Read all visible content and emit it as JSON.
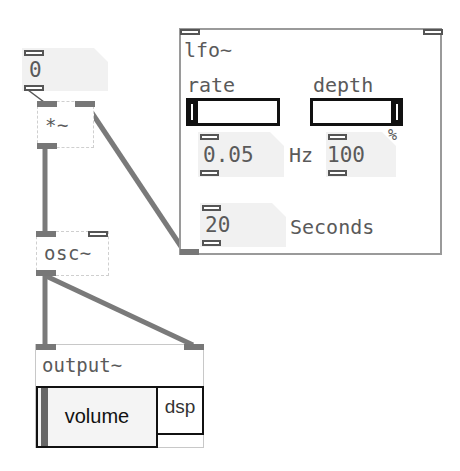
{
  "patch": {
    "top_number": {
      "value": "0"
    },
    "multiply": {
      "label": "*~"
    },
    "osc": {
      "label": "osc~"
    },
    "lfo": {
      "title": "lfo~",
      "rate": {
        "label": "rate",
        "value": "0.05",
        "unit": "Hz"
      },
      "depth": {
        "label": "depth",
        "value": "100",
        "unit": "%"
      },
      "duration": {
        "value": "20",
        "unit": "Seconds"
      }
    },
    "output": {
      "label": "output~",
      "volume_label": "volume",
      "dsp_label": "dsp"
    }
  },
  "colors": {
    "cable": "#7a7a7a",
    "slider": "#111111",
    "numbox_bg": "#f1f1f1",
    "panel_border": "#9a9a9a"
  }
}
